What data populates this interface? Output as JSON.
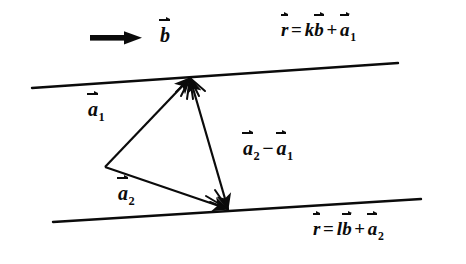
{
  "figure": {
    "kind": "vector-geometry-diagram",
    "background_color": "#ffffff",
    "ink_color": "#0b0b0b",
    "labels": {
      "a1": {
        "name": "a",
        "accent": "vector-arrow",
        "subscript": "1"
      },
      "a2": {
        "name": "a",
        "accent": "vector-arrow",
        "subscript": "2"
      },
      "b": {
        "name": "b",
        "accent": "vector-arrow",
        "subscript": ""
      },
      "difference": {
        "left": {
          "name": "a",
          "accent": "vector-arrow",
          "subscript": "2"
        },
        "operator": "−",
        "right": {
          "name": "a",
          "accent": "vector-arrow",
          "subscript": "1"
        }
      },
      "equation_top": {
        "lhs": {
          "name": "r",
          "accent": "vector-arrow",
          "subscript": ""
        },
        "equals": "=",
        "scalar1": "k",
        "term1": {
          "name": "b",
          "accent": "vector-arrow",
          "subscript": ""
        },
        "plus": "+",
        "term2": {
          "name": "a",
          "accent": "vector-arrow",
          "subscript": "1"
        }
      },
      "equation_bottom": {
        "lhs": {
          "name": "r",
          "accent": "vector-arrow",
          "subscript": ""
        },
        "equals": "=",
        "scalar1": "l",
        "term1": {
          "name": "b",
          "accent": "vector-arrow",
          "subscript": ""
        },
        "plus": "+",
        "term2": {
          "name": "a",
          "accent": "vector-arrow",
          "subscript": "2"
        }
      }
    },
    "geometry": {
      "origin": {
        "x": 105,
        "y": 167
      },
      "top_point": {
        "x": 190,
        "y": 78
      },
      "bottom_point": {
        "x": 228,
        "y": 209
      },
      "line_top": {
        "x1": 32,
        "y1": 88,
        "x2": 398,
        "y2": 63
      },
      "line_bottom": {
        "x1": 53,
        "y1": 222,
        "x2": 421,
        "y2": 199
      },
      "b_arrow": {
        "x1": 90,
        "y1": 38,
        "x2": 141,
        "y2": 38
      }
    }
  }
}
